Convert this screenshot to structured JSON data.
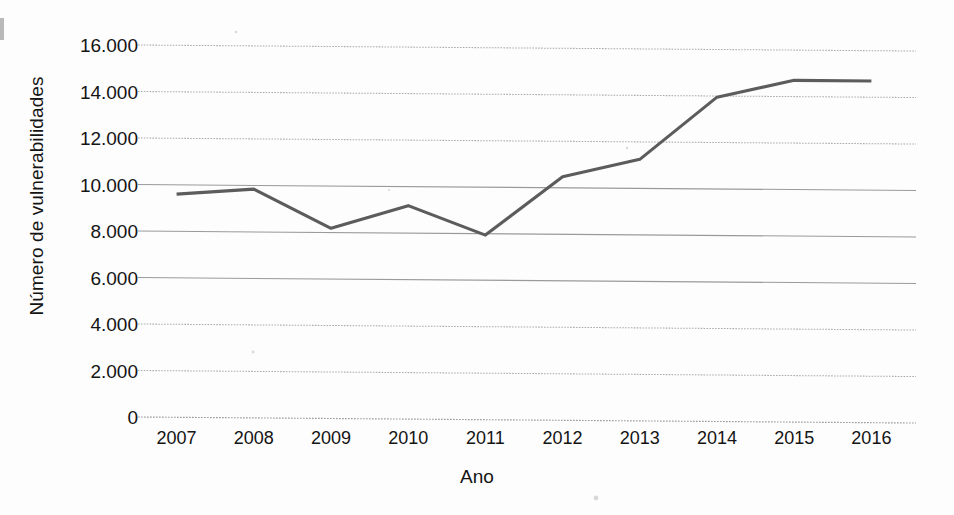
{
  "chart_data": {
    "type": "line",
    "title": "",
    "subtitle": "",
    "xlabel": "Ano",
    "ylabel": "Número de vulnerabilidades",
    "categories": [
      "2007",
      "2008",
      "2009",
      "2010",
      "2011",
      "2012",
      "2013",
      "2014",
      "2015",
      "2016"
    ],
    "x": [
      2007,
      2008,
      2009,
      2010,
      2011,
      2012,
      2013,
      2014,
      2015,
      2016
    ],
    "series": [
      {
        "name": "Número de vulnerabilidades",
        "values": [
          9600,
          9840,
          8180,
          9180,
          7940,
          10480,
          11250,
          13950,
          14700,
          14700
        ],
        "color": "#5c5c5c"
      }
    ],
    "ylim": [
      0,
      16000
    ],
    "ytick_values": [
      0,
      2000,
      4000,
      6000,
      8000,
      10000,
      12000,
      14000,
      16000
    ],
    "ytick_labels": [
      "0",
      "2.000",
      "4.000",
      "6.000",
      "8.000",
      "10.000",
      "12.000",
      "14.000",
      "16.000"
    ],
    "grid": true,
    "grid_axis": "y",
    "legend": false,
    "legend_position": "none",
    "line_color": "#5c5c5c",
    "gridline_color": "#9a9a9a",
    "background_color": "#fdfdfd",
    "text_color": "#141414"
  },
  "axes": {
    "y_title": "Número de vulnerabilidades",
    "x_title": "Ano",
    "y_ticks": [
      {
        "label": "16.000",
        "value": 16000
      },
      {
        "label": "14.000",
        "value": 14000
      },
      {
        "label": "12.000",
        "value": 12000
      },
      {
        "label": "10.000",
        "value": 10000
      },
      {
        "label": "8.000",
        "value": 8000
      },
      {
        "label": "6.000",
        "value": 6000
      },
      {
        "label": "4.000",
        "value": 4000
      },
      {
        "label": "2.000",
        "value": 2000
      },
      {
        "label": "0",
        "value": 0
      }
    ],
    "x_ticks": [
      {
        "label": "2007",
        "value": 2007
      },
      {
        "label": "2008",
        "value": 2008
      },
      {
        "label": "2009",
        "value": 2009
      },
      {
        "label": "2010",
        "value": 2010
      },
      {
        "label": "2011",
        "value": 2011
      },
      {
        "label": "2012",
        "value": 2012
      },
      {
        "label": "2013",
        "value": 2013
      },
      {
        "label": "2014",
        "value": 2014
      },
      {
        "label": "2015",
        "value": 2015
      },
      {
        "label": "2016",
        "value": 2016
      }
    ]
  }
}
